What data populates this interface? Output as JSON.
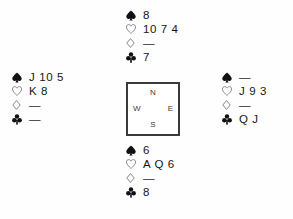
{
  "diagram": {
    "type": "bridge-deal-diagram",
    "void_marker": "—",
    "suit_order": [
      "spade",
      "heart",
      "diamond",
      "club"
    ],
    "suit_symbols": {
      "spade": "spade-icon",
      "heart": "heart-icon",
      "diamond": "diamond-icon",
      "club": "club-icon"
    },
    "colors": {
      "background": "#fefefe",
      "text": "#161616",
      "box_border": "#3a3a3a",
      "filled_suit": "#111111",
      "outline_suit": "#6e6e6e"
    }
  },
  "compass": {
    "north": "N",
    "west": "W",
    "east": "E",
    "south": "S"
  },
  "hands": {
    "north": {
      "position": "North",
      "spades": "8",
      "hearts": "10 7 4",
      "diamonds": "—",
      "clubs": "7"
    },
    "west": {
      "position": "West",
      "spades": "J 10 5",
      "hearts": "K 8",
      "diamonds": "—",
      "clubs": "—"
    },
    "east": {
      "position": "East",
      "spades": "—",
      "hearts": "J 9 3",
      "diamonds": "—",
      "clubs": "Q J"
    },
    "south": {
      "position": "South",
      "spades": "6",
      "hearts": "A Q 6",
      "diamonds": "—",
      "clubs": "8"
    }
  }
}
